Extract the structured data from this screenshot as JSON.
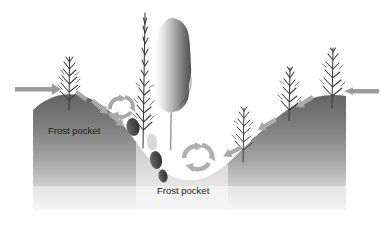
{
  "figure": {
    "background_color": "#ffffff"
  },
  "labels": [
    {
      "id": "frost-pocket-left",
      "text": "Frost pocket",
      "x": 48,
      "y": 134
    },
    {
      "id": "frost-pocket-bottom",
      "text": "Frost pocket",
      "x": 157,
      "y": 194
    }
  ],
  "colors": {
    "ground_top": "#6e6e6e",
    "ground_bottom": "#e9e9e9",
    "arrow_solid": "#9a9a9a",
    "arrow_dashed": "#a8a8a8",
    "tree_bare": "#3a3a3a",
    "tree_columnar_light": "#f2f2f2",
    "tree_columnar_dark": "#5a5a5a",
    "bush_dark": "#3f3f3f",
    "text": "#1a1a1a"
  },
  "elements": {
    "ground_name": "ground-terrain",
    "valley_name": "valley-basin",
    "solid_arrow_left_name": "wind-arrow-left",
    "solid_arrow_right_name": "wind-arrow-right",
    "dashed_arrow_left_slope_name": "cold-air-drainage-arrow-left",
    "dashed_arrow_right_slope_name": "cold-air-drainage-arrow-right",
    "eddy_upper_name": "air-eddy-upper",
    "eddy_lower_name": "air-eddy-lower",
    "tree_left_name": "bare-tree-left",
    "tree_tall_name": "bare-tree-tall-center",
    "tree_columnar_name": "columnar-evergreen-tree",
    "tree_right_inner_name": "bare-tree-right-inner",
    "tree_right_outer_name": "bare-tree-right-outer",
    "bushes_name": "shrub-cluster"
  }
}
